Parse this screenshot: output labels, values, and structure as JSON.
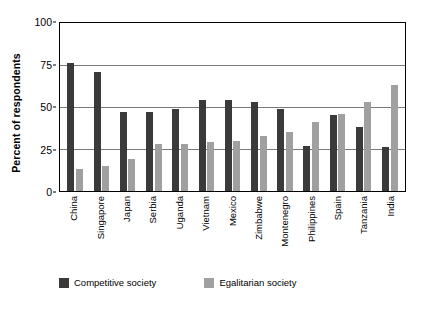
{
  "chart_data": {
    "type": "bar",
    "title": "",
    "xlabel": "",
    "ylabel": "Percent of respondents",
    "ylim": [
      0,
      100
    ],
    "yticks": [
      0,
      25,
      50,
      75,
      100
    ],
    "grid": true,
    "legend_position": "bottom",
    "categories": [
      "China",
      "Singapore",
      "Japan",
      "Serbia",
      "Uganda",
      "Vietnam",
      "Mexico",
      "Zimbabwe",
      "Montenegro",
      "Philippines",
      "Spain",
      "Tanzania",
      "India"
    ],
    "series": [
      {
        "name": "Competitive society",
        "color": "#3a3a3a",
        "values": [
          76,
          71,
          47,
          47,
          49,
          54,
          54,
          53,
          49,
          27,
          45,
          38,
          26
        ]
      },
      {
        "name": "Egalitarian society",
        "color": "#a0a0a0",
        "values": [
          13,
          15,
          19,
          28,
          28,
          29,
          30,
          33,
          35,
          41,
          46,
          53,
          63
        ]
      }
    ]
  },
  "legend": {
    "items": [
      {
        "label": "Competitive society",
        "swatch": "competitive"
      },
      {
        "label": "Egalitarian society",
        "swatch": "egalitarian"
      }
    ]
  }
}
